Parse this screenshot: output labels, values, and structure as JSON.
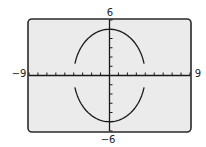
{
  "chart_data": {
    "type": "line",
    "title": "",
    "equation": "x^2/16 + y^2/25 = 1",
    "series": [
      {
        "name": "upper",
        "function": "y = 5*sqrt(1 - x^2/16)",
        "x_domain": [
          -4,
          4
        ]
      },
      {
        "name": "lower",
        "function": "y = -5*sqrt(1 - x^2/16)",
        "x_domain": [
          -4,
          4
        ]
      }
    ],
    "semi_axis_x": 4,
    "semi_axis_y": 5,
    "xlim": [
      -9,
      9
    ],
    "ylim": [
      -6,
      6
    ],
    "xscl": 1,
    "yscl": 1,
    "xlabel": "",
    "ylabel": "",
    "tick_labels": {
      "xmin": "−9",
      "xmax": "9",
      "ymin": "−6",
      "ymax": "6"
    },
    "grid": false,
    "legend": "none",
    "colors": {
      "screen_bg": "#ebebeb",
      "frame": "#2a2a2a",
      "curve": "#1a1a1a",
      "axis": "#1a1a1a"
    }
  }
}
